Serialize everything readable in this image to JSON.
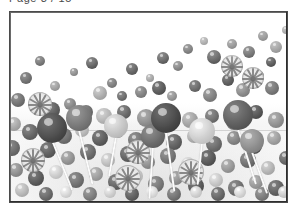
{
  "caption": {
    "text": "Page 3 / 15",
    "color": "#4a4a4a"
  },
  "frame": {
    "border_color": "#4b4b4b",
    "background": "#fdfdfd"
  },
  "photo": {
    "subject": "lollipops-and-candy-balls",
    "description": "Grayscale photograph of a mound of round candies with several lollipops on white sticks rising from the pile; upper area is empty white background.",
    "palette": {
      "white": "#ffffff",
      "light_gray": "#e8e8e8",
      "mid_gray": "#9a9a9a",
      "dark_gray": "#555555",
      "stick_white": "#f7f7f7"
    },
    "balls": [
      {
        "x": 40,
        "y": 61,
        "r": 5,
        "tone": "#6e6e6e"
      },
      {
        "x": 74,
        "y": 72,
        "r": 4,
        "tone": "#8d8d8d"
      },
      {
        "x": 92,
        "y": 63,
        "r": 6,
        "tone": "#5e5e5e"
      },
      {
        "x": 26,
        "y": 78,
        "r": 6,
        "tone": "#707070"
      },
      {
        "x": 55,
        "y": 86,
        "r": 5,
        "tone": "#9b9b9b"
      },
      {
        "x": 112,
        "y": 83,
        "r": 5,
        "tone": "#7c7c7c"
      },
      {
        "x": 132,
        "y": 69,
        "r": 6,
        "tone": "#646464"
      },
      {
        "x": 150,
        "y": 78,
        "r": 4,
        "tone": "#a2a2a2"
      },
      {
        "x": 163,
        "y": 58,
        "r": 6,
        "tone": "#5a5a5a"
      },
      {
        "x": 178,
        "y": 66,
        "r": 5,
        "tone": "#828282"
      },
      {
        "x": 188,
        "y": 49,
        "r": 5,
        "tone": "#666666"
      },
      {
        "x": 204,
        "y": 41,
        "r": 4,
        "tone": "#8f8f8f"
      },
      {
        "x": 214,
        "y": 57,
        "r": 7,
        "tone": "#585858"
      },
      {
        "x": 232,
        "y": 44,
        "r": 5,
        "tone": "#777777"
      },
      {
        "x": 249,
        "y": 52,
        "r": 6,
        "tone": "#5f5f5f"
      },
      {
        "x": 263,
        "y": 36,
        "r": 5,
        "tone": "#6b6b6b"
      },
      {
        "x": 276,
        "y": 47,
        "r": 6,
        "tone": "#8a8a8a"
      },
      {
        "x": 271,
        "y": 62,
        "r": 5,
        "tone": "#545454"
      },
      {
        "x": 286,
        "y": 30,
        "r": 4,
        "tone": "#7a7a7a"
      },
      {
        "x": 100,
        "y": 93,
        "r": 7,
        "tone": "#a8a8a8"
      },
      {
        "x": 122,
        "y": 96,
        "r": 5,
        "tone": "#6c6c6c"
      },
      {
        "x": 141,
        "y": 92,
        "r": 6,
        "tone": "#7f7f7f"
      },
      {
        "x": 159,
        "y": 88,
        "r": 7,
        "tone": "#5b5b5b"
      },
      {
        "x": 172,
        "y": 96,
        "r": 5,
        "tone": "#909090"
      },
      {
        "x": 195,
        "y": 86,
        "r": 6,
        "tone": "#6a6a6a"
      },
      {
        "x": 210,
        "y": 95,
        "r": 7,
        "tone": "#7e7e7e"
      },
      {
        "x": 228,
        "y": 80,
        "r": 6,
        "tone": "#5d5d5d"
      },
      {
        "x": 243,
        "y": 90,
        "r": 7,
        "tone": "#888888"
      },
      {
        "x": 258,
        "y": 76,
        "r": 6,
        "tone": "#616161"
      },
      {
        "x": 272,
        "y": 88,
        "r": 7,
        "tone": "#757575"
      },
      {
        "x": 18,
        "y": 100,
        "r": 7,
        "tone": "#707070"
      },
      {
        "x": 36,
        "y": 104,
        "r": 6,
        "tone": "#9c9c9c"
      },
      {
        "x": 52,
        "y": 110,
        "r": 8,
        "tone": "#5e5e5e"
      },
      {
        "x": 70,
        "y": 104,
        "r": 6,
        "tone": "#848484"
      },
      {
        "x": 86,
        "y": 112,
        "r": 7,
        "tone": "#6d6d6d"
      },
      {
        "x": 104,
        "y": 116,
        "r": 8,
        "tone": "#b0b0b0"
      },
      {
        "x": 124,
        "y": 112,
        "r": 7,
        "tone": "#666666"
      },
      {
        "x": 146,
        "y": 118,
        "r": 9,
        "tone": "#8b8b8b"
      },
      {
        "x": 168,
        "y": 114,
        "r": 7,
        "tone": "#5a5a5a"
      },
      {
        "x": 190,
        "y": 120,
        "r": 8,
        "tone": "#9e9e9e"
      },
      {
        "x": 212,
        "y": 116,
        "r": 7,
        "tone": "#6f6f6f"
      },
      {
        "x": 234,
        "y": 122,
        "r": 8,
        "tone": "#7b7b7b"
      },
      {
        "x": 256,
        "y": 112,
        "r": 7,
        "tone": "#555555"
      },
      {
        "x": 276,
        "y": 120,
        "r": 8,
        "tone": "#8e8e8e"
      },
      {
        "x": 14,
        "y": 124,
        "r": 7,
        "tone": "#a4a4a4"
      },
      {
        "x": 30,
        "y": 132,
        "r": 8,
        "tone": "#636363"
      },
      {
        "x": 48,
        "y": 128,
        "r": 6,
        "tone": "#8c8c8c"
      },
      {
        "x": 64,
        "y": 136,
        "r": 8,
        "tone": "#6e6e6e"
      },
      {
        "x": 82,
        "y": 130,
        "r": 7,
        "tone": "#b4b4b4"
      },
      {
        "x": 100,
        "y": 138,
        "r": 8,
        "tone": "#5c5c5c"
      },
      {
        "x": 118,
        "y": 132,
        "r": 6,
        "tone": "#979797"
      },
      {
        "x": 136,
        "y": 140,
        "r": 8,
        "tone": "#707070"
      },
      {
        "x": 154,
        "y": 134,
        "r": 7,
        "tone": "#868686"
      },
      {
        "x": 174,
        "y": 142,
        "r": 8,
        "tone": "#5f5f5f"
      },
      {
        "x": 194,
        "y": 136,
        "r": 7,
        "tone": "#a9a9a9"
      },
      {
        "x": 214,
        "y": 144,
        "r": 8,
        "tone": "#6a6a6a"
      },
      {
        "x": 234,
        "y": 138,
        "r": 7,
        "tone": "#818181"
      },
      {
        "x": 254,
        "y": 146,
        "r": 8,
        "tone": "#585858"
      },
      {
        "x": 274,
        "y": 138,
        "r": 7,
        "tone": "#9b9b9b"
      },
      {
        "x": 12,
        "y": 148,
        "r": 8,
        "tone": "#6b6b6b"
      },
      {
        "x": 30,
        "y": 156,
        "r": 7,
        "tone": "#bdbdbd"
      },
      {
        "x": 48,
        "y": 150,
        "r": 8,
        "tone": "#5d5d5d"
      },
      {
        "x": 68,
        "y": 158,
        "r": 7,
        "tone": "#8f8f8f"
      },
      {
        "x": 88,
        "y": 152,
        "r": 8,
        "tone": "#696969"
      },
      {
        "x": 108,
        "y": 160,
        "r": 7,
        "tone": "#b8b8b8"
      },
      {
        "x": 128,
        "y": 154,
        "r": 8,
        "tone": "#606060"
      },
      {
        "x": 148,
        "y": 162,
        "r": 7,
        "tone": "#8a8a8a"
      },
      {
        "x": 168,
        "y": 156,
        "r": 8,
        "tone": "#727272"
      },
      {
        "x": 188,
        "y": 164,
        "r": 7,
        "tone": "#c2c2c2"
      },
      {
        "x": 208,
        "y": 158,
        "r": 8,
        "tone": "#575757"
      },
      {
        "x": 228,
        "y": 166,
        "r": 7,
        "tone": "#939393"
      },
      {
        "x": 248,
        "y": 160,
        "r": 8,
        "tone": "#6d6d6d"
      },
      {
        "x": 268,
        "y": 168,
        "r": 7,
        "tone": "#aeaeae"
      },
      {
        "x": 286,
        "y": 158,
        "r": 7,
        "tone": "#666666"
      },
      {
        "x": 16,
        "y": 170,
        "r": 7,
        "tone": "#8b8b8b"
      },
      {
        "x": 36,
        "y": 178,
        "r": 8,
        "tone": "#5a5a5a"
      },
      {
        "x": 56,
        "y": 172,
        "r": 7,
        "tone": "#c6c6c6"
      },
      {
        "x": 76,
        "y": 180,
        "r": 8,
        "tone": "#6f6f6f"
      },
      {
        "x": 96,
        "y": 174,
        "r": 7,
        "tone": "#9a9a9a"
      },
      {
        "x": 116,
        "y": 182,
        "r": 8,
        "tone": "#626262"
      },
      {
        "x": 136,
        "y": 176,
        "r": 7,
        "tone": "#bcbcbc"
      },
      {
        "x": 156,
        "y": 184,
        "r": 8,
        "tone": "#747474"
      },
      {
        "x": 176,
        "y": 178,
        "r": 7,
        "tone": "#8d8d8d"
      },
      {
        "x": 196,
        "y": 186,
        "r": 8,
        "tone": "#595959"
      },
      {
        "x": 216,
        "y": 180,
        "r": 7,
        "tone": "#c0c0c0"
      },
      {
        "x": 236,
        "y": 188,
        "r": 8,
        "tone": "#6c6c6c"
      },
      {
        "x": 256,
        "y": 182,
        "r": 7,
        "tone": "#959595"
      },
      {
        "x": 276,
        "y": 188,
        "r": 8,
        "tone": "#616161"
      },
      {
        "x": 22,
        "y": 190,
        "r": 7,
        "tone": "#b2b2b2"
      },
      {
        "x": 46,
        "y": 194,
        "r": 7,
        "tone": "#676767"
      },
      {
        "x": 66,
        "y": 192,
        "r": 6,
        "tone": "#d0d0d0"
      },
      {
        "x": 90,
        "y": 194,
        "r": 7,
        "tone": "#7a7a7a"
      },
      {
        "x": 110,
        "y": 192,
        "r": 6,
        "tone": "#c8c8c8"
      },
      {
        "x": 132,
        "y": 194,
        "r": 7,
        "tone": "#5e5e5e"
      },
      {
        "x": 152,
        "y": 192,
        "r": 6,
        "tone": "#d4d4d4"
      },
      {
        "x": 174,
        "y": 194,
        "r": 7,
        "tone": "#707070"
      },
      {
        "x": 196,
        "y": 192,
        "r": 6,
        "tone": "#cacaca"
      },
      {
        "x": 218,
        "y": 194,
        "r": 7,
        "tone": "#656565"
      },
      {
        "x": 240,
        "y": 192,
        "r": 6,
        "tone": "#cecece"
      },
      {
        "x": 262,
        "y": 194,
        "r": 7,
        "tone": "#787878"
      },
      {
        "x": 284,
        "y": 192,
        "r": 6,
        "tone": "#c4c4c4"
      }
    ],
    "lollipop_heads": [
      {
        "x": 52,
        "y": 128,
        "r": 15,
        "tone": "#4d4d4d"
      },
      {
        "x": 79,
        "y": 118,
        "r": 13,
        "tone": "#767676"
      },
      {
        "x": 116,
        "y": 126,
        "r": 12,
        "tone": "#c0c0c0"
      },
      {
        "x": 153,
        "y": 136,
        "r": 12,
        "tone": "#6a6a6a"
      },
      {
        "x": 166,
        "y": 118,
        "r": 15,
        "tone": "#4a4a4a"
      },
      {
        "x": 202,
        "y": 131,
        "r": 13,
        "tone": "#c9c9c9"
      },
      {
        "x": 238,
        "y": 115,
        "r": 15,
        "tone": "#5e5e5e"
      },
      {
        "x": 252,
        "y": 141,
        "r": 12,
        "tone": "#8b8b8b"
      }
    ],
    "swirl_lollipops": [
      {
        "x": 40,
        "y": 104,
        "r": 12
      },
      {
        "x": 33,
        "y": 160,
        "r": 12
      },
      {
        "x": 138,
        "y": 152,
        "r": 12
      },
      {
        "x": 128,
        "y": 178,
        "r": 13
      },
      {
        "x": 191,
        "y": 172,
        "r": 13
      },
      {
        "x": 253,
        "y": 78,
        "r": 11
      },
      {
        "x": 232,
        "y": 66,
        "r": 11
      }
    ],
    "sticks": [
      {
        "x": 52,
        "y": 140,
        "len": 54,
        "angle": -22
      },
      {
        "x": 79,
        "y": 130,
        "len": 56,
        "angle": -14
      },
      {
        "x": 116,
        "y": 137,
        "len": 40,
        "angle": 10
      },
      {
        "x": 153,
        "y": 147,
        "len": 52,
        "angle": 4
      },
      {
        "x": 166,
        "y": 132,
        "len": 60,
        "angle": -8
      },
      {
        "x": 202,
        "y": 143,
        "len": 42,
        "angle": 6
      },
      {
        "x": 238,
        "y": 129,
        "len": 58,
        "angle": -18
      },
      {
        "x": 252,
        "y": 152,
        "len": 44,
        "angle": -20
      }
    ]
  }
}
